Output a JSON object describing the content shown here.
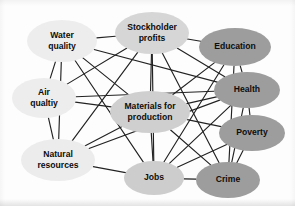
{
  "diagram": {
    "type": "node-link-network",
    "background_color": "#fdfdfd",
    "edge_color": "#222222",
    "label_color": "#0d0d0d",
    "shades": {
      "light": "#ececec",
      "medium": "#c9c9c9",
      "dark": "#9a9a9a"
    },
    "nodes": [
      {
        "id": "water_quality",
        "label_line1": "Water",
        "label_line2": "quality",
        "cx": 62,
        "cy": 41,
        "rx": 35,
        "ry": 21,
        "shade": "light",
        "fill": "#ededed"
      },
      {
        "id": "stockholder_profits",
        "label_line1": "Stockholder",
        "label_line2": "profits",
        "cx": 152,
        "cy": 33,
        "rx": 37,
        "ry": 21,
        "shade": "medium",
        "fill": "#d6d6d6"
      },
      {
        "id": "education",
        "label_line1": "Education",
        "label_line2": "",
        "cx": 235,
        "cy": 47,
        "rx": 36,
        "ry": 19,
        "shade": "dark",
        "fill": "#9d9d9d"
      },
      {
        "id": "air_quality",
        "label_line1": "Air",
        "label_line2": "qualtiy",
        "cx": 44,
        "cy": 98,
        "rx": 32,
        "ry": 20,
        "shade": "light",
        "fill": "#ededed"
      },
      {
        "id": "health",
        "label_line1": "Health",
        "label_line2": "",
        "cx": 247,
        "cy": 90,
        "rx": 33,
        "ry": 18,
        "shade": "dark",
        "fill": "#9d9d9d"
      },
      {
        "id": "materials_for_production",
        "label_line1": "Materials for",
        "label_line2": "production",
        "cx": 150,
        "cy": 112,
        "rx": 40,
        "ry": 21,
        "shade": "medium",
        "fill": "#cfcfcf"
      },
      {
        "id": "poverty",
        "label_line1": "Poverty",
        "label_line2": "",
        "cx": 252,
        "cy": 133,
        "rx": 33,
        "ry": 18,
        "shade": "dark",
        "fill": "#9d9d9d"
      },
      {
        "id": "natural_resources",
        "label_line1": "Natural",
        "label_line2": "resources",
        "cx": 58,
        "cy": 160,
        "rx": 37,
        "ry": 21,
        "shade": "light",
        "fill": "#ececec"
      },
      {
        "id": "jobs",
        "label_line1": "Jobs",
        "label_line2": "",
        "cx": 154,
        "cy": 178,
        "rx": 30,
        "ry": 17,
        "shade": "medium",
        "fill": "#cdcdcd"
      },
      {
        "id": "crime",
        "label_line1": "Crime",
        "label_line2": "",
        "cx": 228,
        "cy": 180,
        "rx": 32,
        "ry": 18,
        "shade": "dark",
        "fill": "#9d9d9d"
      }
    ],
    "edges": [
      {
        "from": "water_quality",
        "to": "stockholder_profits"
      },
      {
        "from": "water_quality",
        "to": "air_quality"
      },
      {
        "from": "water_quality",
        "to": "natural_resources"
      },
      {
        "from": "water_quality",
        "to": "materials_for_production"
      },
      {
        "from": "water_quality",
        "to": "health"
      },
      {
        "from": "water_quality",
        "to": "jobs"
      },
      {
        "from": "stockholder_profits",
        "to": "education"
      },
      {
        "from": "stockholder_profits",
        "to": "health"
      },
      {
        "from": "stockholder_profits",
        "to": "materials_for_production"
      },
      {
        "from": "stockholder_profits",
        "to": "natural_resources"
      },
      {
        "from": "stockholder_profits",
        "to": "air_quality"
      },
      {
        "from": "stockholder_profits",
        "to": "jobs"
      },
      {
        "from": "stockholder_profits",
        "to": "crime"
      },
      {
        "from": "education",
        "to": "health"
      },
      {
        "from": "education",
        "to": "crime"
      },
      {
        "from": "education",
        "to": "jobs"
      },
      {
        "from": "education",
        "to": "materials_for_production"
      },
      {
        "from": "air_quality",
        "to": "natural_resources"
      },
      {
        "from": "air_quality",
        "to": "materials_for_production"
      },
      {
        "from": "air_quality",
        "to": "health"
      },
      {
        "from": "health",
        "to": "poverty"
      },
      {
        "from": "health",
        "to": "crime"
      },
      {
        "from": "health",
        "to": "natural_resources"
      },
      {
        "from": "health",
        "to": "materials_for_production"
      },
      {
        "from": "health",
        "to": "jobs"
      },
      {
        "from": "materials_for_production",
        "to": "natural_resources"
      },
      {
        "from": "materials_for_production",
        "to": "jobs"
      },
      {
        "from": "materials_for_production",
        "to": "poverty"
      },
      {
        "from": "materials_for_production",
        "to": "crime"
      },
      {
        "from": "poverty",
        "to": "crime"
      },
      {
        "from": "poverty",
        "to": "jobs"
      },
      {
        "from": "natural_resources",
        "to": "jobs"
      },
      {
        "from": "jobs",
        "to": "crime"
      }
    ]
  }
}
